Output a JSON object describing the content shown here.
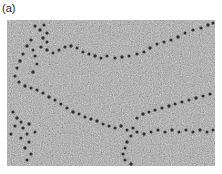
{
  "figure": {
    "panel_label": "(a)",
    "image": {
      "description": "Electron micrograph of chromatin fibers showing nucleosome beads on DNA strings",
      "background_color": "#a9a9a9",
      "bead_color": "#2e2e2e"
    }
  }
}
